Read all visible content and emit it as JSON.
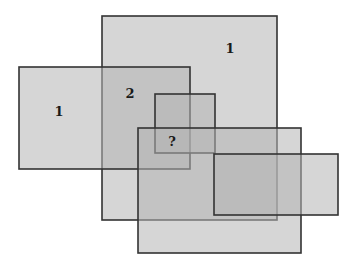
{
  "diagram": {
    "type": "overlapping-rectangles-puzzle",
    "rect_fill": "#b4b4b4",
    "rect_fill_opacity": 0.55,
    "stroke_color": "#333333",
    "rectangles": [
      {
        "id": "A",
        "x": 102,
        "y": 16,
        "w": 175,
        "h": 204
      },
      {
        "id": "B",
        "x": 19,
        "y": 67,
        "w": 171,
        "h": 102
      },
      {
        "id": "C",
        "x": 155,
        "y": 94,
        "w": 60,
        "h": 59
      },
      {
        "id": "D",
        "x": 138,
        "y": 128,
        "w": 163,
        "h": 125
      },
      {
        "id": "E",
        "x": 214,
        "y": 154,
        "w": 124,
        "h": 61
      }
    ],
    "labels": [
      {
        "text": "1",
        "x": 230,
        "y": 53
      },
      {
        "text": "1",
        "x": 59,
        "y": 116
      },
      {
        "text": "2",
        "x": 130,
        "y": 98
      },
      {
        "text": "?",
        "x": 172,
        "y": 146
      }
    ]
  }
}
